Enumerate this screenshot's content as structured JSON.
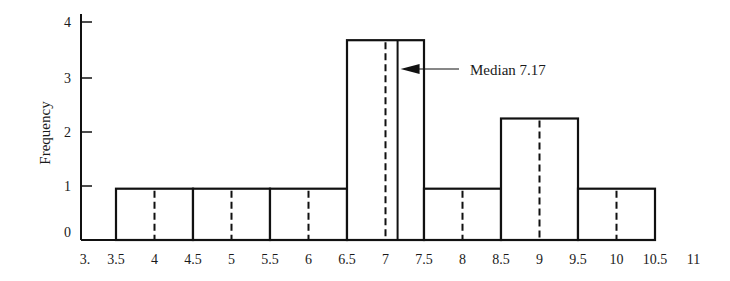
{
  "chart_data": {
    "type": "bar",
    "subtype": "histogram",
    "title": "",
    "xlabel": "",
    "ylabel": "Frequency",
    "xlim": [
      3,
      11
    ],
    "ylim": [
      0,
      4
    ],
    "grid": false,
    "x_ticks": [
      "3.",
      "3.5",
      "4",
      "4.5",
      "5",
      "5.5",
      "6",
      "6.5",
      "7",
      "7.5",
      "8",
      "8.5",
      "9",
      "9.5",
      "10",
      "10.5",
      "11"
    ],
    "x_tick_values": [
      3,
      3.5,
      4,
      4.5,
      5,
      5.5,
      6,
      6.5,
      7,
      7.5,
      8,
      8.5,
      9,
      9.5,
      10,
      10.5,
      11
    ],
    "y_ticks": [
      "0",
      "1",
      "2",
      "3",
      "4"
    ],
    "y_tick_values": [
      0,
      1,
      2,
      3,
      4
    ],
    "bins": [
      {
        "from": 3.5,
        "to": 4.5,
        "midpoint": 4,
        "value": 0.95
      },
      {
        "from": 4.5,
        "to": 5.5,
        "midpoint": 5,
        "value": 0.95
      },
      {
        "from": 5.5,
        "to": 6.5,
        "midpoint": 6,
        "value": 0.95
      },
      {
        "from": 6.5,
        "to": 7.5,
        "midpoint": 7,
        "value": 3.7
      },
      {
        "from": 7.5,
        "to": 8.5,
        "midpoint": 8,
        "value": 0.95
      },
      {
        "from": 8.5,
        "to": 9.5,
        "midpoint": 9,
        "value": 2.25
      },
      {
        "from": 9.5,
        "to": 10.5,
        "midpoint": 10,
        "value": 0.95
      }
    ],
    "annotations": [
      {
        "label": "Median 7.17",
        "x": 7.17,
        "type": "vertical-line-with-arrow"
      }
    ],
    "midpoint_lines": "dashed"
  }
}
